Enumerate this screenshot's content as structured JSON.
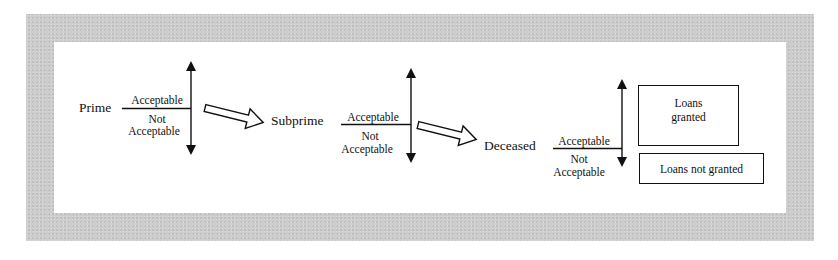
{
  "diagram": {
    "type": "flow",
    "stages": [
      {
        "name": "Prime",
        "upper_label": "Acceptable",
        "lower_label_line1": "Not",
        "lower_label_line2": "Acceptable"
      },
      {
        "name": "Subprime",
        "upper_label": "Acceptable",
        "lower_label_line1": "Not",
        "lower_label_line2": "Acceptable"
      },
      {
        "name": "Deceased",
        "upper_label": "Acceptable",
        "lower_label_line1": "Not",
        "lower_label_line2": "Acceptable"
      }
    ],
    "outcomes": {
      "granted_line1": "Loans",
      "granted_line2": "granted",
      "not_granted": "Loans not granted"
    },
    "colors": {
      "frame": "#cdcdcd",
      "panel": "#ffffff",
      "ink": "#111111"
    }
  }
}
